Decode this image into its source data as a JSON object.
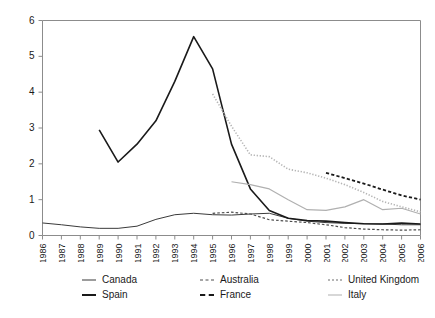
{
  "chart_data": {
    "type": "line",
    "title": "",
    "subtitle": "",
    "xlabel": "",
    "ylabel": "",
    "xlim": [
      1986,
      2006
    ],
    "ylim": [
      0,
      6
    ],
    "yticks": [
      0,
      1,
      2,
      3,
      4,
      5,
      6
    ],
    "grid": false,
    "legend_position": "bottom",
    "legend_columns": 3,
    "x": [
      1986,
      1987,
      1988,
      1989,
      1990,
      1991,
      1992,
      1993,
      1994,
      1995,
      1996,
      1997,
      1998,
      1999,
      2000,
      2001,
      2002,
      2003,
      2004,
      2005,
      2006
    ],
    "categories": [
      "1986",
      "1987",
      "1988",
      "1989",
      "1990",
      "1991",
      "1992",
      "1993",
      "1994",
      "1995",
      "1996",
      "1997",
      "1998",
      "1999",
      "2000",
      "2001",
      "2002",
      "2003",
      "2004",
      "2005",
      "2006"
    ],
    "series": [
      {
        "name": "Canada",
        "style": "solid",
        "color": "#3a3a3a",
        "width": 1,
        "x": [
          1986,
          1987,
          1988,
          1989,
          1990,
          1991,
          1992,
          1993,
          1994,
          1995,
          1996,
          1997,
          1998,
          1999,
          2000,
          2001,
          2002,
          2003,
          2004,
          2005,
          2006
        ],
        "values": [
          0.35,
          0.3,
          0.24,
          0.2,
          0.2,
          0.26,
          0.45,
          0.58,
          0.62,
          0.58,
          0.57,
          0.6,
          0.62,
          0.48,
          0.4,
          0.36,
          0.34,
          0.33,
          0.32,
          0.3,
          0.3
        ]
      },
      {
        "name": "Spain",
        "style": "solid",
        "color": "#1a1a1a",
        "width": 1.6,
        "x": [
          1989,
          1990,
          1991,
          1992,
          1993,
          1994,
          1995,
          1996,
          1997,
          1998,
          1999,
          2000,
          2001,
          2002,
          2003,
          2004,
          2005,
          2006
        ],
        "values": [
          2.95,
          2.05,
          2.55,
          3.2,
          4.3,
          5.55,
          4.65,
          2.55,
          1.3,
          0.7,
          0.48,
          0.42,
          0.4,
          0.36,
          0.33,
          0.32,
          0.35,
          0.32
        ]
      },
      {
        "name": "Australia",
        "style": "dashed",
        "color": "#4d4d4d",
        "width": 1.2,
        "x": [
          1995,
          1996,
          1997,
          1998,
          1999,
          2000,
          2001,
          2002,
          2003,
          2004,
          2005,
          2006
        ],
        "values": [
          0.62,
          0.65,
          0.6,
          0.44,
          0.4,
          0.36,
          0.3,
          0.22,
          0.18,
          0.16,
          0.15,
          0.16
        ]
      },
      {
        "name": "France",
        "style": "dashed",
        "color": "#1a1a1a",
        "width": 1.8,
        "x": [
          2001,
          2002,
          2003,
          2004,
          2005,
          2006
        ],
        "values": [
          1.75,
          1.6,
          1.45,
          1.28,
          1.12,
          1.0
        ]
      },
      {
        "name": "United Kingdom",
        "style": "dotted",
        "color": "#b5b5b5",
        "width": 1.6,
        "x": [
          1995,
          1996,
          1997,
          1998,
          1999,
          2000,
          2001,
          2002,
          2003,
          2004,
          2005,
          2006
        ],
        "values": [
          3.95,
          3.05,
          2.25,
          2.2,
          1.85,
          1.75,
          1.6,
          1.42,
          1.2,
          0.95,
          0.8,
          0.66
        ]
      },
      {
        "name": "Italy",
        "style": "solid",
        "color": "#b0b0b0",
        "width": 1.2,
        "x": [
          1996,
          1997,
          1998,
          1999,
          2000,
          2001,
          2002,
          2003,
          2004,
          2005,
          2006
        ],
        "values": [
          1.5,
          1.42,
          1.3,
          1.0,
          0.72,
          0.7,
          0.8,
          1.0,
          0.72,
          0.76,
          0.6
        ]
      }
    ]
  },
  "legend": {
    "items": [
      {
        "label": "Canada"
      },
      {
        "label": "Australia"
      },
      {
        "label": "United Kingdom"
      },
      {
        "label": "Spain"
      },
      {
        "label": "France"
      },
      {
        "label": "Italy"
      }
    ]
  }
}
